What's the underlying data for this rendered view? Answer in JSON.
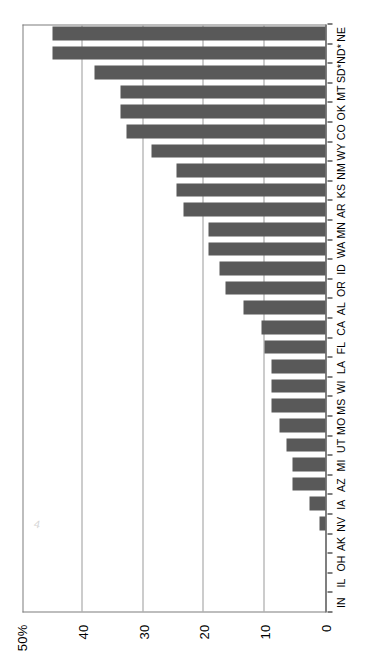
{
  "chart_data": {
    "type": "bar",
    "orientation": "vertical-rendered-rotated",
    "title": "",
    "subtitle": "",
    "xlabel": "",
    "ylabel": "",
    "ylim": [
      0,
      50
    ],
    "grid": true,
    "legend": null,
    "legend_position": "none",
    "bar_color": "#595959",
    "axis_color": "#000000",
    "gridline_color": "#9a9a9a",
    "ytick_labels": [
      "0",
      "10",
      "20",
      "30",
      "40",
      "50%"
    ],
    "ytick_values": [
      0,
      10,
      20,
      30,
      40,
      50
    ],
    "categories": [
      "IN",
      "IL",
      "OH",
      "AK",
      "NV",
      "IA",
      "AZ",
      "MI",
      "UT",
      "MO",
      "MS",
      "WI",
      "LA",
      "FL",
      "CA",
      "AL",
      "OR",
      "ID",
      "WA",
      "MN",
      "AR",
      "KS",
      "NM",
      "WY",
      "CO",
      "OK",
      "MT",
      "SD*",
      "ND*",
      "NE"
    ],
    "values": [
      0,
      0,
      0,
      0,
      1,
      2.6,
      5.4,
      5.4,
      6.4,
      7.6,
      8.9,
      8.9,
      8.9,
      10.1,
      10.5,
      13.5,
      16.5,
      17.5,
      19.3,
      19.3,
      23.4,
      24.5,
      24.5,
      28.7,
      32.8,
      33.8,
      33.8,
      38.0,
      44.9,
      44.9
    ],
    "annotations": [
      "ND* and SD* are marked with an asterisk"
    ]
  },
  "scan": {
    "artifact_mark": "4"
  }
}
